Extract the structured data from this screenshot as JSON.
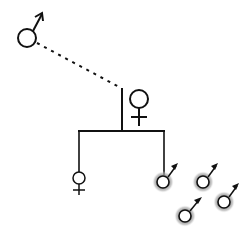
{
  "diagram": {
    "type": "pedigree",
    "colors": {
      "stroke": "#111111",
      "halo": "#9a9a9a",
      "background": "#ffffff"
    },
    "nodes": [
      {
        "id": "father",
        "symbol": "male",
        "shaded": false,
        "cx": 27,
        "cy": 38,
        "r": 9
      },
      {
        "id": "mother",
        "symbol": "female",
        "shaded": false,
        "cx": 139,
        "cy": 99,
        "r": 9
      },
      {
        "id": "daughter",
        "symbol": "female",
        "shaded": false,
        "cx": 79,
        "cy": 178,
        "r": 6
      },
      {
        "id": "son-1",
        "symbol": "male",
        "shaded": true,
        "cx": 163,
        "cy": 182,
        "r": 6
      },
      {
        "id": "son-2",
        "symbol": "male",
        "shaded": true,
        "cx": 203,
        "cy": 182,
        "r": 6
      },
      {
        "id": "son-3",
        "symbol": "male",
        "shaded": true,
        "cx": 224,
        "cy": 202,
        "r": 6
      },
      {
        "id": "son-4",
        "symbol": "male",
        "shaded": true,
        "cx": 185,
        "cy": 216,
        "r": 6
      }
    ],
    "connections": [
      {
        "id": "father-mother-dotted",
        "style": "dotted",
        "from": [
          37,
          43
        ],
        "to": [
          121,
          88
        ]
      },
      {
        "id": "mother-vertical",
        "style": "solid",
        "from": [
          122,
          88
        ],
        "to": [
          122,
          131
        ]
      },
      {
        "id": "sibship-line",
        "style": "solid",
        "from": [
          78,
          131
        ],
        "to": [
          164,
          131
        ]
      },
      {
        "id": "daughter-branch",
        "style": "solid",
        "from": [
          79,
          131
        ],
        "to": [
          79,
          172
        ]
      },
      {
        "id": "son-branch",
        "style": "solid",
        "from": [
          164,
          131
        ],
        "to": [
          164,
          175
        ]
      }
    ]
  }
}
